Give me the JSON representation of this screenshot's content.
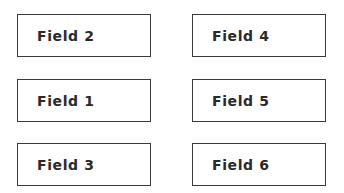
{
  "fields": [
    {
      "label": "Field 2",
      "column": "left",
      "row": 1
    },
    {
      "label": "Field 1",
      "column": "left",
      "row": 2
    },
    {
      "label": "Field 3",
      "column": "left",
      "row": 3
    },
    {
      "label": "Field 4",
      "column": "right",
      "row": 1
    },
    {
      "label": "Field 5",
      "column": "right",
      "row": 2
    },
    {
      "label": "Field 6",
      "column": "right",
      "row": 3
    }
  ],
  "colors": {
    "border": "#3a3a3a",
    "text": "#2a2a2a",
    "background": "#ffffff"
  }
}
